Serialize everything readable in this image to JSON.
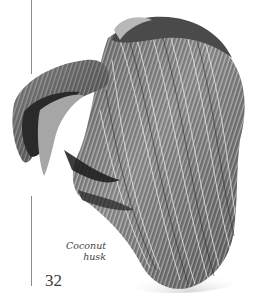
{
  "page": {
    "figure": {
      "subject": "coconut-husk-photo",
      "caption_lines": [
        "Coconut",
        "husk"
      ]
    },
    "page_number": "32",
    "colors": {
      "rule": "#8a8a8a",
      "caption_text": "#444444",
      "page_number_text": "#3a3a3a"
    }
  }
}
